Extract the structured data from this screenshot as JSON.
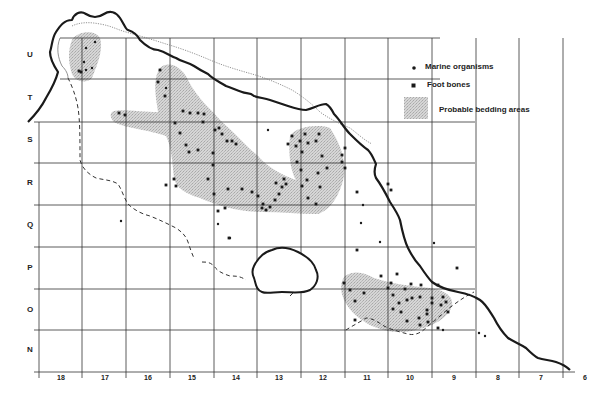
{
  "legend": {
    "items": [
      {
        "symbol": "dot",
        "label": "Marine organisms"
      },
      {
        "symbol": "square",
        "label": "Foot bones"
      },
      {
        "symbol": "stipple",
        "label": "Probable bedding areas"
      }
    ]
  },
  "grid": {
    "row_labels": [
      "U",
      "T",
      "S",
      "R",
      "Q",
      "P",
      "O",
      "N"
    ],
    "row_label_y": [
      55,
      98,
      140,
      183,
      225,
      268,
      310,
      350
    ],
    "col_labels": [
      "18",
      "17",
      "16",
      "15",
      "14",
      "13",
      "12",
      "11",
      "10",
      "9",
      "8",
      "7",
      "6"
    ],
    "col_label_x": [
      61,
      105,
      148,
      192,
      236,
      279,
      323,
      367,
      410,
      454,
      498,
      541,
      585
    ],
    "vertical_lines_x": [
      39,
      82,
      126,
      170,
      214,
      257,
      301,
      345,
      388,
      432,
      476,
      519,
      563
    ],
    "horizontal_lines_y": [
      38,
      79,
      122,
      163,
      205,
      247,
      289,
      330,
      372
    ]
  },
  "colors": {
    "coastline": "#1a1a1a",
    "grid": "#333333",
    "bedding": "#c8c8c8",
    "symbols": "#1a1a1a",
    "dashed": "#333333",
    "dotted": "#777777"
  },
  "marine_organisms": [
    [
      86,
      48
    ],
    [
      95,
      42
    ],
    [
      84,
      62
    ],
    [
      86,
      70
    ],
    [
      92,
      68
    ],
    [
      166,
      88
    ],
    [
      218,
      224
    ],
    [
      121,
      221
    ],
    [
      230,
      238
    ],
    [
      268,
      130
    ],
    [
      363,
      205
    ],
    [
      361,
      223
    ],
    [
      380,
      242
    ],
    [
      434,
      243
    ],
    [
      479,
      333
    ],
    [
      485,
      336
    ],
    [
      443,
      330
    ]
  ],
  "foot_bones": [
    [
      79,
      71
    ],
    [
      81,
      72
    ],
    [
      119,
      113
    ],
    [
      125,
      115
    ],
    [
      160,
      70
    ],
    [
      158,
      82
    ],
    [
      165,
      96
    ],
    [
      183,
      111
    ],
    [
      190,
      113
    ],
    [
      198,
      113
    ],
    [
      204,
      114
    ],
    [
      203,
      122
    ],
    [
      215,
      130
    ],
    [
      219,
      128
    ],
    [
      222,
      134
    ],
    [
      227,
      141
    ],
    [
      232,
      141
    ],
    [
      236,
      144
    ],
    [
      175,
      123
    ],
    [
      180,
      133
    ],
    [
      186,
      145
    ],
    [
      189,
      152
    ],
    [
      198,
      150
    ],
    [
      213,
      165
    ],
    [
      214,
      194
    ],
    [
      208,
      179
    ],
    [
      225,
      208
    ],
    [
      229,
      238
    ],
    [
      218,
      211
    ],
    [
      228,
      189
    ],
    [
      166,
      185
    ],
    [
      176,
      186
    ],
    [
      174,
      179
    ],
    [
      213,
      153
    ],
    [
      242,
      189
    ],
    [
      252,
      192
    ],
    [
      258,
      196
    ],
    [
      263,
      204
    ],
    [
      266,
      210
    ],
    [
      270,
      207
    ],
    [
      275,
      200
    ],
    [
      279,
      194
    ],
    [
      282,
      187
    ],
    [
      276,
      183
    ],
    [
      284,
      179
    ],
    [
      286,
      184
    ],
    [
      301,
      170
    ],
    [
      307,
      180
    ],
    [
      302,
      186
    ],
    [
      308,
      198
    ],
    [
      316,
      204
    ],
    [
      320,
      187
    ],
    [
      318,
      173
    ],
    [
      327,
      168
    ],
    [
      322,
      156
    ],
    [
      316,
      141
    ],
    [
      308,
      143
    ],
    [
      300,
      141
    ],
    [
      296,
      146
    ],
    [
      302,
      152
    ],
    [
      297,
      162
    ],
    [
      288,
      144
    ],
    [
      292,
      136
    ],
    [
      305,
      134
    ],
    [
      319,
      134
    ],
    [
      342,
      162
    ],
    [
      345,
      148
    ],
    [
      342,
      155
    ],
    [
      345,
      168
    ],
    [
      262,
      208
    ],
    [
      357,
      192
    ],
    [
      388,
      184
    ],
    [
      391,
      190
    ],
    [
      357,
      250
    ],
    [
      364,
      293
    ],
    [
      381,
      276
    ],
    [
      388,
      288
    ],
    [
      393,
      295
    ],
    [
      399,
      303
    ],
    [
      407,
      300
    ],
    [
      421,
      285
    ],
    [
      407,
      321
    ],
    [
      419,
      318
    ],
    [
      427,
      310
    ],
    [
      432,
      303
    ],
    [
      441,
      305
    ],
    [
      446,
      302
    ],
    [
      428,
      322
    ],
    [
      438,
      328
    ],
    [
      393,
      309
    ],
    [
      401,
      312
    ],
    [
      412,
      298
    ],
    [
      411,
      284
    ],
    [
      438,
      285
    ],
    [
      420,
      297
    ],
    [
      397,
      274
    ],
    [
      391,
      283
    ],
    [
      344,
      283
    ],
    [
      355,
      301
    ],
    [
      350,
      290
    ],
    [
      457,
      268
    ],
    [
      432,
      298
    ],
    [
      443,
      297
    ],
    [
      420,
      325
    ],
    [
      427,
      314
    ],
    [
      355,
      320
    ],
    [
      448,
      312
    ],
    [
      405,
      289
    ]
  ],
  "bedding_areas": [
    {
      "name": "bedding-area-u17",
      "path": "M72,40 C78,30 96,30 100,38 C104,50 96,68 92,78 C86,84 76,82 72,74 C68,62 68,50 72,40 Z"
    },
    {
      "name": "bedding-area-main",
      "path": "M112,112 C116,108 140,112 158,112 C156,98 152,80 160,68 C168,60 182,66 188,80 C198,100 214,112 222,122 C234,132 246,146 258,156 C268,168 284,176 296,180 C290,170 288,150 290,136 C296,126 320,124 330,128 C338,140 346,156 344,176 C340,196 330,210 318,214 C300,214 280,212 262,212 C240,212 218,206 200,198 C186,194 176,188 174,178 C172,162 172,148 166,136 C150,130 124,128 114,122 C110,118 110,114 112,112 Z"
    },
    {
      "name": "bedding-area-o10",
      "path": "M345,276 C354,270 364,272 374,278 C392,284 410,286 430,288 C444,290 454,296 452,306 C448,318 434,326 416,330 C400,334 386,332 372,326 C360,320 350,312 344,300 C340,290 340,282 345,276 Z"
    }
  ],
  "coastline_path": "M28,122 C34,116 40,110 46,98 C52,88 56,80 58,72 C54,66 50,58 50,52 C52,46 52,38 56,32 C60,26 64,20 72,20 C74,14 80,10 86,14 C92,18 98,18 104,14 C110,10 116,12 120,18 C124,24 126,30 128,30 C134,32 138,36 140,40 C146,46 152,50 158,50 C166,52 170,56 176,58 C182,62 188,62 194,66 C200,70 204,72 208,74 C214,80 220,82 226,86 C232,88 236,90 242,92 C246,94 250,92 254,96 C260,98 264,98 270,100 C276,102 282,104 288,106 C294,108 300,110 306,110 C314,108 320,104 326,104 C330,106 332,110 334,114 C340,120 344,128 350,134 C356,140 362,146 368,150 C372,154 374,160 376,164 C374,170 374,174 376,178 C382,186 386,194 390,202 C394,208 398,214 400,220 C402,230 404,240 408,248 C412,256 416,262 420,266 C424,272 428,278 432,282 C440,288 448,290 458,292 C468,294 474,296 480,300 C486,304 490,312 494,318 C498,326 502,332 508,338 C514,342 520,344 526,348 C530,352 534,356 538,358 C544,360 550,360 556,362 C562,364 566,366 570,370",
  "inner_dotted_path": "M72,26 C80,22 90,22 100,24 C112,26 118,30 126,32 C140,36 154,40 166,44 C180,48 196,54 210,60 C224,66 238,70 252,74 C266,78 280,84 292,90 C302,96 312,104 320,112 C328,118 340,124 350,128 C358,134 364,140 372,144",
  "inner_dotted_path2": "M60,38 C56,48 58,58 62,66 C66,70 68,74 68,78",
  "dashed_path": "M68,78 C72,86 76,96 78,108 C80,120 80,140 80,160 C82,168 88,174 96,178 C104,180 112,180 118,184 C122,190 124,198 128,204 C134,210 142,214 150,216 C160,220 168,224 176,228 C182,232 186,236 188,242 C190,248 192,254 194,258",
  "dashed_path2": "M202,262 C206,262 210,262 214,266 C218,272 224,274 230,276 C236,276 240,276 246,280",
  "dashed_path3": "M290,296 C294,292 298,288 300,284",
  "dashed_path4": "M346,330 C352,326 360,322 366,318 C372,318 378,322 384,326 C392,330 400,332 408,334 C416,336 422,332 428,326 C436,320 444,312 452,306 C460,300 466,296 474,292",
  "lake_path": "M254,266 C258,258 264,252 272,250 C280,246 290,248 298,252 C306,256 314,262 316,270 C320,278 316,286 310,290 C302,294 292,292 282,292 C274,292 266,294 262,292 C256,290 256,284 254,278 C252,274 252,270 254,266 Z"
}
